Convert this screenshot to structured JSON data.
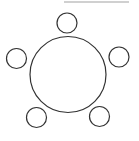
{
  "diagram": {
    "type": "table-seating",
    "stroke_color": "#333333",
    "fill_color": "#ffffff",
    "table": {
      "cx": 68,
      "cy": 74.5,
      "r": 38
    },
    "seats": [
      {
        "id": "top",
        "cx": 67,
        "cy": 23,
        "r": 10
      },
      {
        "id": "left",
        "cx": 16.5,
        "cy": 58.5,
        "r": 10
      },
      {
        "id": "right",
        "cx": 119,
        "cy": 57,
        "r": 10
      },
      {
        "id": "bottom-left",
        "cx": 36.5,
        "cy": 117.5,
        "r": 10
      },
      {
        "id": "bottom-right",
        "cx": 99.5,
        "cy": 116.5,
        "r": 10
      }
    ],
    "top_bar_color": "#d0d0d0"
  }
}
